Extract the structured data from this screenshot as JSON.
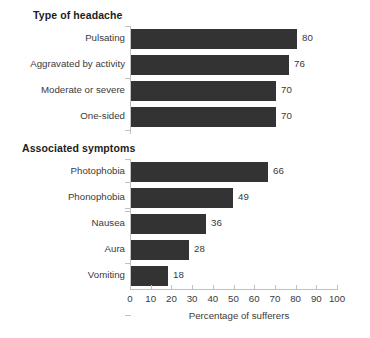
{
  "chart_data": {
    "type": "bar",
    "orientation": "horizontal",
    "title": "",
    "xlabel": "Percentage of sufferers",
    "ylabel": "",
    "xlim": [
      0,
      100
    ],
    "xticks": [
      0,
      10,
      20,
      30,
      40,
      50,
      60,
      70,
      80,
      90,
      100
    ],
    "grid": false,
    "legend": false,
    "bar_color": "#333333",
    "axis_color": "#c0c0c0",
    "text_color": "#3a3a3a",
    "background": "#ffffff",
    "groups": [
      {
        "title": "Type of headache",
        "categories": [
          "Pulsating",
          "Aggravated by activity",
          "Moderate or severe",
          "One-sided"
        ],
        "values": [
          80,
          76,
          70,
          70
        ]
      },
      {
        "title": "Associated symptoms",
        "categories": [
          "Photophobia",
          "Phonophobia",
          "Nausea",
          "Aura",
          "Vomiting"
        ],
        "values": [
          66,
          49,
          36,
          28,
          18
        ]
      }
    ]
  }
}
